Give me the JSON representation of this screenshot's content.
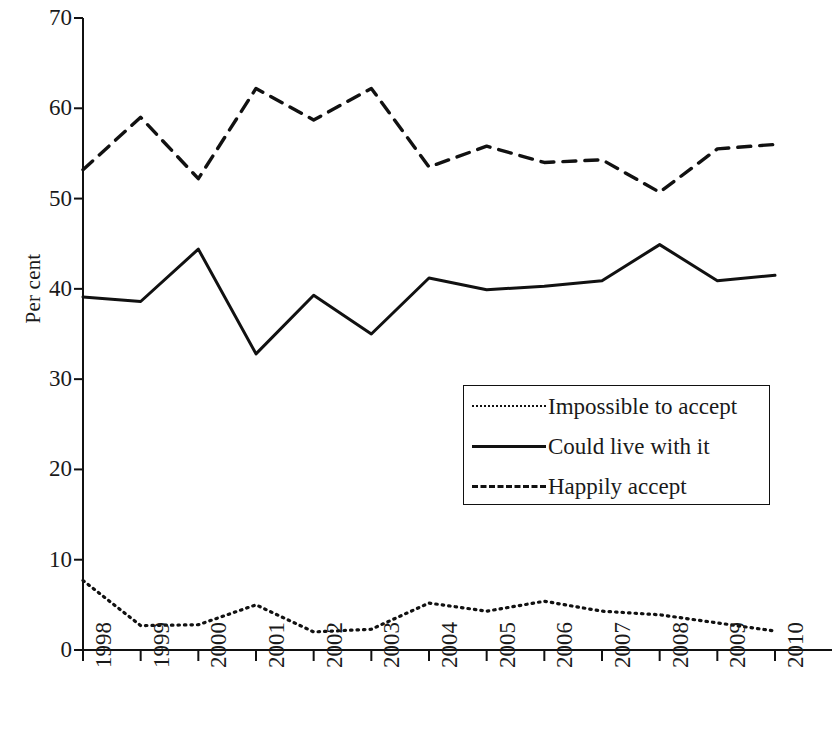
{
  "chart_data": {
    "type": "line",
    "title": "",
    "xlabel": "",
    "ylabel": "Per cent",
    "categories": [
      "1998",
      "1999",
      "2000",
      "2001",
      "2002",
      "2003",
      "2004",
      "2005",
      "2006",
      "2007",
      "2008",
      "2009",
      "2010"
    ],
    "ylim": [
      0,
      70
    ],
    "yticks": [
      0,
      10,
      20,
      30,
      40,
      50,
      60,
      70
    ],
    "grid": false,
    "legend_position": "center-right",
    "series": [
      {
        "name": "Impossible to accept",
        "style": "dotted",
        "color": "#111111",
        "values": [
          7.7,
          2.7,
          2.8,
          5.0,
          2.0,
          2.3,
          5.2,
          4.3,
          5.4,
          4.3,
          3.9,
          3.0,
          2.1
        ]
      },
      {
        "name": "Could live with it",
        "style": "solid",
        "color": "#111111",
        "values": [
          39.1,
          38.6,
          44.4,
          32.8,
          39.3,
          35.0,
          41.2,
          39.9,
          40.3,
          40.9,
          44.9,
          40.9,
          41.5
        ]
      },
      {
        "name": "Happily accept",
        "style": "dashed",
        "color": "#111111",
        "values": [
          53.2,
          59.0,
          52.2,
          62.2,
          58.7,
          62.2,
          53.5,
          55.8,
          54.0,
          54.3,
          50.7,
          55.5,
          56.0
        ]
      }
    ]
  },
  "axis": {
    "y_label": "Per cent",
    "y_tick_labels": [
      "70",
      "60",
      "50",
      "40",
      "30",
      "20",
      "10",
      "0"
    ],
    "x_tick_labels": [
      "1998",
      "1999",
      "2000",
      "2001",
      "2002",
      "2003",
      "2004",
      "2005",
      "2006",
      "2007",
      "2008",
      "2009",
      "2010"
    ]
  },
  "legend": {
    "items": [
      {
        "label": "Impossible to accept",
        "key": "dotted-line-key"
      },
      {
        "label": "Could live with it",
        "key": "solid-line-key"
      },
      {
        "label": "Happily accept",
        "key": "dashed-line-key"
      }
    ]
  }
}
